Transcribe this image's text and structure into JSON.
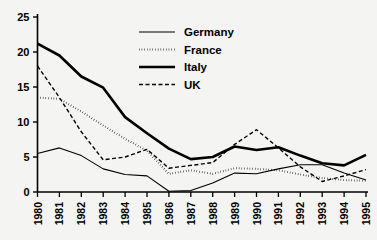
{
  "chart_data": {
    "type": "line",
    "title": "",
    "subtitle": "",
    "xlabel": "",
    "ylabel": "",
    "x": [
      "1980",
      "1981",
      "1982",
      "1983",
      "1984",
      "1985",
      "1986",
      "1987",
      "1988",
      "1989",
      "1990",
      "1991",
      "1992",
      "1993",
      "1994",
      "1995"
    ],
    "categories": [
      "1980",
      "1981",
      "1982",
      "1983",
      "1984",
      "1985",
      "1986",
      "1987",
      "1988",
      "1989",
      "1990",
      "1991",
      "1992",
      "1993",
      "1994",
      "1995"
    ],
    "xlim": [
      "1980",
      "1995"
    ],
    "ylim": [
      0,
      25
    ],
    "yticks": [
      0,
      5,
      10,
      15,
      20,
      25
    ],
    "ytick_labels": [
      "0",
      "5",
      "10",
      "15",
      "20",
      "25"
    ],
    "grid": false,
    "legend_position": "top-center",
    "series": [
      {
        "name": "Germany",
        "style": "solid-thin",
        "color": "#000000",
        "stroke_width": 1.1,
        "dash": "none",
        "values": [
          5.5,
          6.3,
          5.2,
          3.3,
          2.5,
          2.3,
          0.1,
          0.2,
          1.3,
          2.7,
          2.6,
          3.3,
          3.9,
          3.9,
          2.7,
          1.7
        ]
      },
      {
        "name": "France",
        "style": "dotted",
        "color": "#000000",
        "stroke_width": 2.0,
        "dash": "0.5,2.2",
        "values": [
          13.5,
          13.3,
          11.5,
          9.5,
          7.6,
          5.9,
          2.6,
          3.1,
          2.6,
          3.4,
          3.3,
          3.1,
          2.5,
          2.0,
          1.7,
          1.6
        ]
      },
      {
        "name": "Italy",
        "style": "solid-thick",
        "color": "#000000",
        "stroke_width": 2.6,
        "dash": "none",
        "values": [
          21.2,
          19.5,
          16.5,
          14.9,
          10.7,
          8.4,
          6.2,
          4.7,
          5.0,
          6.5,
          6.0,
          6.4,
          5.2,
          4.1,
          3.8,
          5.3
        ]
      },
      {
        "name": "UK",
        "style": "dashed",
        "color": "#000000",
        "stroke_width": 1.4,
        "dash": "4,2.5",
        "values": [
          18.0,
          13.5,
          8.6,
          4.6,
          5.0,
          6.1,
          3.4,
          3.8,
          4.2,
          6.8,
          8.9,
          6.3,
          3.6,
          1.5,
          2.3,
          3.2
        ]
      }
    ]
  },
  "legend": {
    "items": [
      {
        "label": "Germany",
        "swatch": "legend-swatch-solid-thin"
      },
      {
        "label": "France",
        "swatch": "legend-swatch-dotted"
      },
      {
        "label": "Italy",
        "swatch": "legend-swatch-solid-thick"
      },
      {
        "label": "UK",
        "swatch": "legend-swatch-dashed"
      }
    ]
  }
}
